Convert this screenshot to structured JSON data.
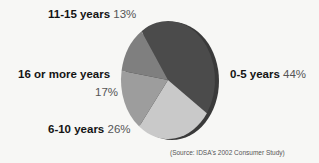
{
  "chart_data": {
    "type": "pie",
    "title": "",
    "categories": [
      "0-5 years",
      "6-10 years",
      "16 or more years",
      "11-15 years"
    ],
    "values": [
      44,
      26,
      17,
      13
    ],
    "unit": "%",
    "slices": [
      {
        "label": "0-5 years",
        "value": 44,
        "value_label": "44%",
        "color": "#4b4b4b"
      },
      {
        "label": "6-10 years",
        "value": 26,
        "value_label": "26%",
        "color": "#c9c9c9"
      },
      {
        "label": "16 or more years",
        "value": 17,
        "value_label": "17%",
        "color": "#9d9d9d"
      },
      {
        "label": "11-15 years",
        "value": 13,
        "value_label": "13%",
        "color": "#7f7f7f"
      }
    ],
    "legend": "none (labels placed beside slices)",
    "style": "3D tilted grayscale pie",
    "source": "(Source: IDSA's 2002 Consumer Study)"
  },
  "labels": {
    "l0": {
      "category": "0-5 years",
      "percent": "44%"
    },
    "l1": {
      "category": "6-10 years",
      "percent": "26%"
    },
    "l2": {
      "category": "16 or more years",
      "percent": "17%"
    },
    "l3": {
      "category": "11-15 years",
      "percent": "13%"
    }
  },
  "source_note": "(Source: IDSA's 2002 Consumer Study)",
  "colors": {
    "rim": "#3a3a3a",
    "background": "#f7f7f5"
  }
}
